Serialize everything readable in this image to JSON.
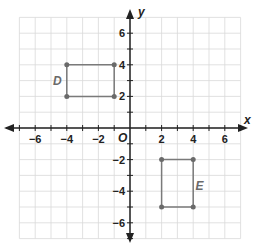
{
  "graph": {
    "x_axis_label": "x",
    "y_axis_label": "y",
    "origin_label": "O",
    "x_ticks": [
      {
        "value": -6,
        "label": "−6"
      },
      {
        "value": -4,
        "label": "−4"
      },
      {
        "value": -2,
        "label": "−2"
      },
      {
        "value": 2,
        "label": "2"
      },
      {
        "value": 4,
        "label": "4"
      },
      {
        "value": 6,
        "label": "6"
      }
    ],
    "y_ticks": [
      {
        "value": 6,
        "label": "6"
      },
      {
        "value": 4,
        "label": "4"
      },
      {
        "value": 2,
        "label": "2"
      },
      {
        "value": -2,
        "label": "−2"
      },
      {
        "value": -4,
        "label": "−4"
      },
      {
        "value": -6,
        "label": "−6"
      }
    ],
    "grid_range": {
      "xmin": -7,
      "xmax": 7,
      "ymin": -7,
      "ymax": 7
    },
    "colors": {
      "grid": "#d9d9d9",
      "axis": "#222222",
      "shape": "#7a7a7a",
      "vertex": "#6a6a6a"
    },
    "shapes": [
      {
        "name": "D",
        "label": "D",
        "vertices": [
          [
            -4,
            4
          ],
          [
            -1,
            4
          ],
          [
            -1,
            2
          ],
          [
            -4,
            2
          ]
        ],
        "label_pos": [
          -4.6,
          3
        ]
      },
      {
        "name": "E",
        "label": "E",
        "vertices": [
          [
            2,
            -2
          ],
          [
            4,
            -2
          ],
          [
            4,
            -5
          ],
          [
            2,
            -5
          ]
        ],
        "label_pos": [
          4.4,
          -3.7
        ]
      }
    ]
  }
}
